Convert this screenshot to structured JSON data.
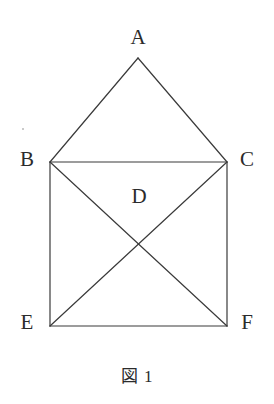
{
  "figure": {
    "caption": "図 1",
    "stroke_color": "#3a3a3a",
    "background_color": "#ffffff",
    "label_color": "#2b2b2b",
    "stroke_width": 1.2,
    "canvas": {
      "width": 274,
      "height": 404
    },
    "vertices": [
      {
        "id": "A",
        "label": "A",
        "x": 138,
        "y": 58,
        "label_x": 138,
        "label_y": 38
      },
      {
        "id": "B",
        "label": "B",
        "x": 50,
        "y": 162,
        "label_x": 27,
        "label_y": 160
      },
      {
        "id": "C",
        "label": "C",
        "x": 227,
        "y": 162,
        "label_x": 247,
        "label_y": 160
      },
      {
        "id": "D",
        "label": "D",
        "x": 138,
        "y": 197,
        "label_x": 138,
        "label_y": 197
      },
      {
        "id": "E",
        "label": "E",
        "x": 50,
        "y": 326,
        "label_x": 27,
        "label_y": 323
      },
      {
        "id": "F",
        "label": "F",
        "x": 227,
        "y": 326,
        "label_x": 247,
        "label_y": 323
      }
    ],
    "edges": [
      {
        "name": "A-B",
        "from": "A",
        "to": "B",
        "x1": 138,
        "y1": 58,
        "x2": 50,
        "y2": 162
      },
      {
        "name": "A-C",
        "from": "A",
        "to": "C",
        "x1": 138,
        "y1": 58,
        "x2": 227,
        "y2": 162
      },
      {
        "name": "B-C",
        "from": "B",
        "to": "C",
        "x1": 50,
        "y1": 162,
        "x2": 227,
        "y2": 162
      },
      {
        "name": "B-E",
        "from": "B",
        "to": "E",
        "x1": 50,
        "y1": 162,
        "x2": 50,
        "y2": 326
      },
      {
        "name": "C-F",
        "from": "C",
        "to": "F",
        "x1": 227,
        "y1": 162,
        "x2": 227,
        "y2": 326
      },
      {
        "name": "E-F",
        "from": "E",
        "to": "F",
        "x1": 50,
        "y1": 326,
        "x2": 227,
        "y2": 326
      },
      {
        "name": "B-F",
        "from": "B",
        "to": "F",
        "x1": 50,
        "y1": 162,
        "x2": 227,
        "y2": 326
      },
      {
        "name": "C-E",
        "from": "C",
        "to": "E",
        "x1": 227,
        "y1": 162,
        "x2": 50,
        "y2": 326
      }
    ],
    "intersection": {
      "name": "diagonal-crossing",
      "x": 138,
      "y": 244
    }
  }
}
